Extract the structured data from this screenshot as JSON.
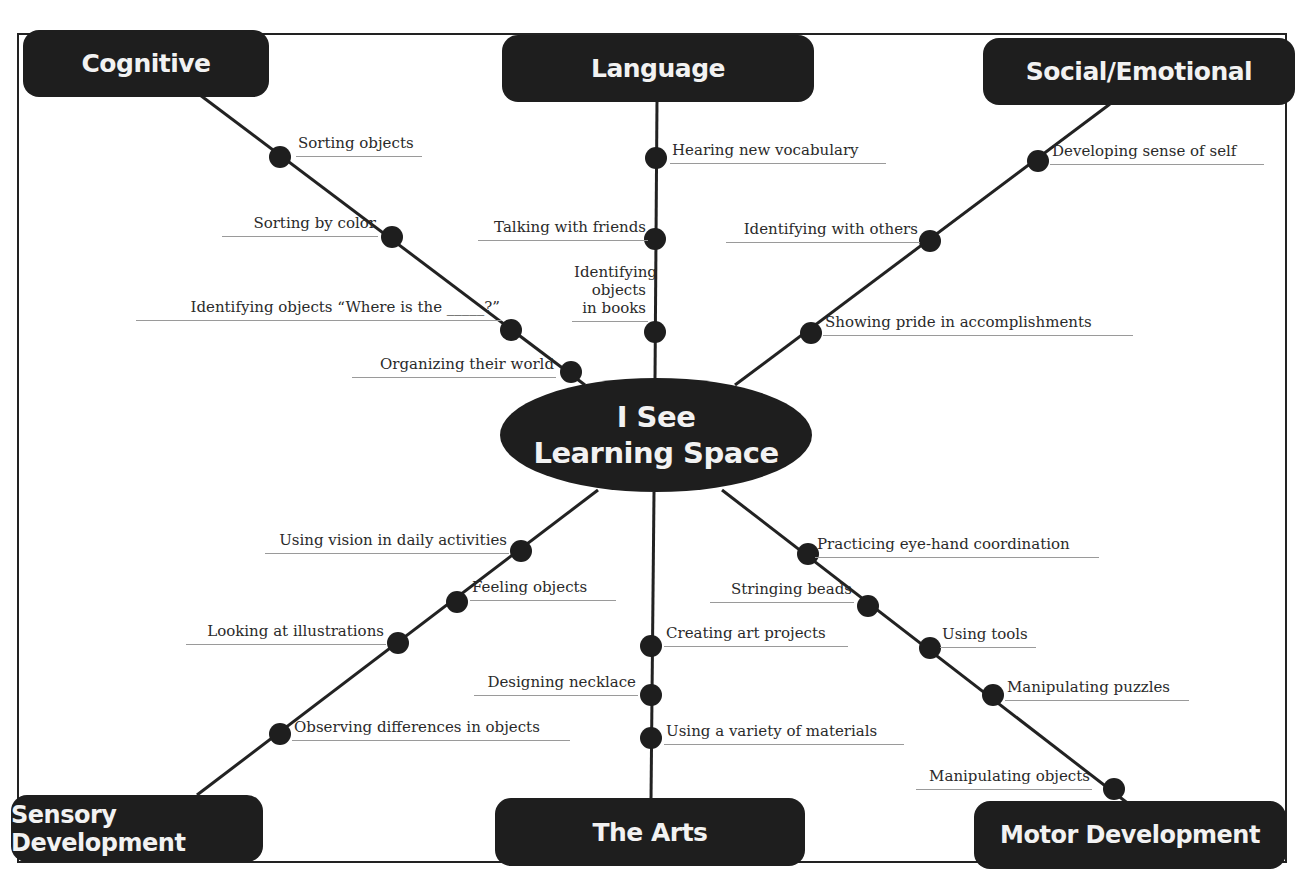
{
  "center": {
    "line1": "I See",
    "line2": "Learning Space"
  },
  "categories": {
    "cognitive": "Cognitive",
    "language": "Language",
    "social": "Social/Emotional",
    "sensory": "Sensory Development",
    "arts": "The Arts",
    "motor": "Motor Development"
  },
  "branches": {
    "cognitive": [
      "Sorting objects",
      "Sorting by color",
      "Identifying objects “Where is the _____?”",
      "Organizing their world"
    ],
    "language": [
      "Hearing new vocabulary",
      "Talking with friends",
      "Identifying objects in books"
    ],
    "social": [
      "Developing sense of self",
      "Identifying with others",
      "Showing pride in accomplishments"
    ],
    "sensory": [
      "Using vision in daily activities",
      "Feeling objects",
      "Looking at illustrations",
      "Observing differences in objects"
    ],
    "arts": [
      "Creating art projects",
      "Designing necklace",
      "Using a variety of materials"
    ],
    "motor": [
      "Practicing eye-hand coordination",
      "Stringing beads",
      "Using tools",
      "Manipulating puzzles",
      "Manipulating objects"
    ]
  },
  "colors": {
    "node": "#1e1e1e",
    "line": "#222222",
    "underline": "#9a9a9a",
    "text": "#2a2a2a"
  }
}
